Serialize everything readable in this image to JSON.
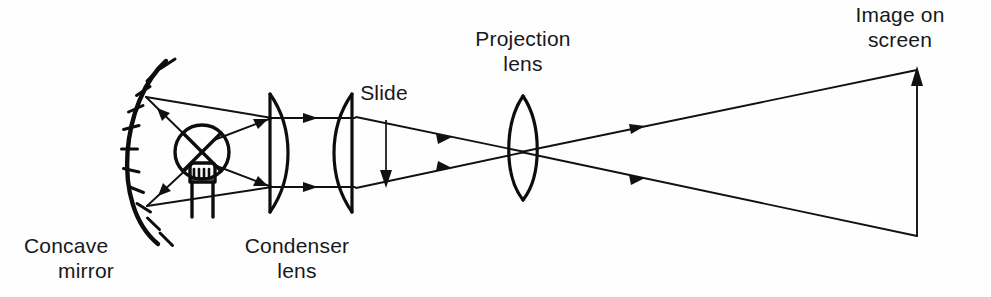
{
  "figure": {
    "background_color": "#fefefe",
    "ink_color": "#0d0d0f",
    "width": 991,
    "height": 297
  },
  "labels": {
    "concave_mirror_line1": "Concave",
    "concave_mirror_line2": "mirror",
    "condenser_lens_line1": "Condenser",
    "condenser_lens_line2": "lens",
    "slide": "Slide",
    "projection_lens_line1": "Projection",
    "projection_lens_line2": "lens",
    "image_on_screen_line1": "Image on",
    "image_on_screen_line2": "screen"
  },
  "components": [
    {
      "id": "concave-mirror",
      "name": "Concave mirror",
      "type": "mirror",
      "shape": "concave arc with hatching on back side",
      "hatch_count": 11,
      "center_x": 140,
      "top_y": 62,
      "bottom_y": 238
    },
    {
      "id": "lamp",
      "name": "Lamp",
      "type": "light-source",
      "shape": "circle with crossed rays and filament",
      "center_x": 202,
      "center_y": 152,
      "radius": 27
    },
    {
      "id": "condenser-lens",
      "name": "Condenser lens",
      "type": "lens",
      "shape": "two plano-convex elements",
      "element1_x": 271,
      "element2_x": 343
    },
    {
      "id": "slide",
      "name": "Slide",
      "type": "object",
      "shape": "vertical arrow pointing down",
      "x": 386,
      "top_y": 120,
      "bottom_y": 186
    },
    {
      "id": "projection-lens",
      "name": "Projection lens",
      "type": "lens",
      "shape": "biconvex",
      "center_x": 523,
      "top_y": 96,
      "bottom_y": 200
    },
    {
      "id": "image-on-screen",
      "name": "Image on screen",
      "type": "image",
      "shape": "vertical arrow pointing up (inverted image)",
      "x": 917,
      "top_y": 68,
      "bottom_y": 236
    }
  ],
  "rays": [
    {
      "id": "lamp-to-mirror-upper",
      "from": "lamp",
      "to": "concave-mirror",
      "direction": "leftward-up"
    },
    {
      "id": "lamp-to-mirror-lower",
      "from": "lamp",
      "to": "concave-mirror",
      "direction": "leftward-down"
    },
    {
      "id": "mirror-to-condenser-upper",
      "from": "concave-mirror",
      "to": "condenser-lens",
      "direction": "rightward-up"
    },
    {
      "id": "mirror-to-condenser-lower",
      "from": "concave-mirror",
      "to": "condenser-lens",
      "direction": "rightward-down"
    },
    {
      "id": "condenser-collimated-upper",
      "from": "condenser-lens",
      "to": "slide",
      "direction": "rightward"
    },
    {
      "id": "condenser-collimated-lower",
      "from": "condenser-lens",
      "to": "slide",
      "direction": "rightward"
    },
    {
      "id": "slide-to-projection-upper",
      "from": "slide",
      "to": "projection-lens",
      "direction": "rightward-converging"
    },
    {
      "id": "slide-to-projection-lower",
      "from": "slide",
      "to": "projection-lens",
      "direction": "rightward-converging"
    },
    {
      "id": "projection-to-screen-upper",
      "from": "projection-lens",
      "to": "image-on-screen",
      "direction": "rightward-diverging"
    },
    {
      "id": "projection-to-screen-lower",
      "from": "projection-lens",
      "to": "image-on-screen",
      "direction": "rightward-diverging"
    }
  ]
}
